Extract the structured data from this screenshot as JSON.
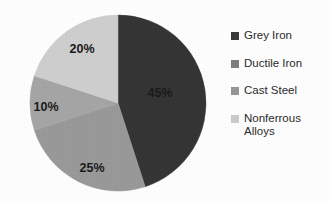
{
  "chart_data": {
    "type": "pie",
    "title": "",
    "subtitle": "",
    "xlabel": "",
    "ylabel": "",
    "grid": false,
    "legend_position": "right",
    "start_angle_deg": 0,
    "direction": "clockwise",
    "categories": [
      "Grey Iron",
      "Ductile Iron",
      "Cast Steel",
      "Nonferrous Alloys"
    ],
    "values": [
      45,
      25,
      10,
      20
    ],
    "value_unit": "%",
    "data_labels": [
      "45%",
      "25%",
      "10%",
      "20%"
    ],
    "slices": [
      {
        "label": "Grey Iron",
        "value": 45,
        "data_label": "45%",
        "color": "#353535",
        "start_deg": 0,
        "end_deg": 162,
        "label_x": 160,
        "label_y": 97
      },
      {
        "label": "Ductile Iron",
        "value": 25,
        "data_label": "25%",
        "color": "#9a9a9a",
        "start_deg": 162,
        "end_deg": 252,
        "label_x": 92,
        "label_y": 172
      },
      {
        "label": "Cast Steel",
        "value": 10,
        "data_label": "10%",
        "color": "#a6a6a6",
        "start_deg": 252,
        "end_deg": 288,
        "label_x": 46,
        "label_y": 111
      },
      {
        "label": "Nonferrous Alloys",
        "value": 20,
        "data_label": "20%",
        "color": "#cfcfcf",
        "start_deg": 288,
        "end_deg": 360,
        "label_x": 82,
        "label_y": 53
      }
    ],
    "geometry": {
      "center_x": 118,
      "center_y": 103,
      "radius": 88
    }
  },
  "legend": {
    "items": [
      {
        "label": "Grey Iron",
        "color": "#3b3b3b"
      },
      {
        "label": "Ductile Iron",
        "color": "#7e7e7e"
      },
      {
        "label": "Cast Steel",
        "color": "#989898"
      },
      {
        "label": "Nonferrous\nAlloys",
        "color": "#cccccc"
      }
    ]
  }
}
